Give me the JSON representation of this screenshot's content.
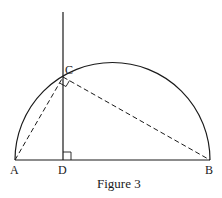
{
  "figure": {
    "caption": "Figure 3",
    "points": {
      "A": {
        "label": "A",
        "x": 15,
        "y": 160
      },
      "B": {
        "label": "B",
        "x": 210,
        "y": 160
      },
      "C": {
        "label": "C",
        "x": 63,
        "y": 77
      },
      "D": {
        "label": "D",
        "x": 63,
        "y": 160
      }
    },
    "semicircle": {
      "center_x": 112.5,
      "center_y": 160,
      "radius": 97.5
    },
    "perpendicular_line": {
      "x": 63,
      "y_top": 12,
      "y_bottom": 160
    },
    "right_angle_marks": [
      "at D between DC and DB",
      "at C between CA and CB"
    ],
    "segments": {
      "solid": [
        "AB",
        "DC (extended upward)"
      ],
      "dashed": [
        "AC",
        "CB"
      ]
    },
    "colors": {
      "stroke": "#1a1a1a",
      "background": "#ffffff"
    }
  }
}
